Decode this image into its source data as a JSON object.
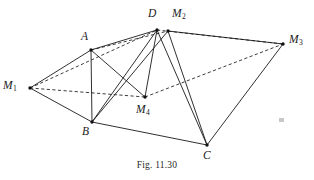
{
  "figure": {
    "caption": "Fig. 11.30",
    "stroke_color": "#1a1a1a",
    "background_color": "#ffffff",
    "vertices": [
      {
        "id": "M1",
        "label": "M",
        "subscript": "1",
        "x": 30,
        "y": 88,
        "label_x": 3,
        "label_y": 80
      },
      {
        "id": "A",
        "label": "A",
        "subscript": "",
        "x": 91,
        "y": 50,
        "label_x": 81,
        "label_y": 31
      },
      {
        "id": "B",
        "label": "B",
        "subscript": "",
        "x": 92,
        "y": 122,
        "label_x": 82,
        "label_y": 126
      },
      {
        "id": "D",
        "label": "D",
        "subscript": "",
        "x": 157,
        "y": 30,
        "label_x": 148,
        "label_y": 8
      },
      {
        "id": "M2",
        "label": "M",
        "subscript": "2",
        "x": 168,
        "y": 31,
        "label_x": 172,
        "label_y": 8
      },
      {
        "id": "M3",
        "label": "M",
        "subscript": "3",
        "x": 283,
        "y": 44,
        "label_x": 289,
        "label_y": 34
      },
      {
        "id": "C",
        "label": "C",
        "subscript": "",
        "x": 207,
        "y": 145,
        "label_x": 203,
        "label_y": 150
      },
      {
        "id": "M4",
        "label": "M",
        "subscript": "4",
        "x": 145,
        "y": 97,
        "label_x": 136,
        "label_y": 104
      }
    ],
    "edges_solid": [
      {
        "name": "M1-A",
        "from": "M1",
        "to": "A"
      },
      {
        "name": "M1-B",
        "from": "M1",
        "to": "B"
      },
      {
        "name": "A-B",
        "from": "A",
        "to": "B"
      },
      {
        "name": "A-D",
        "from": "A",
        "to": "D"
      },
      {
        "name": "A-M4",
        "from": "A",
        "to": "M4"
      },
      {
        "name": "B-C",
        "from": "B",
        "to": "C"
      },
      {
        "name": "B-D",
        "from": "B",
        "to": "D"
      },
      {
        "name": "B-M2",
        "from": "B",
        "to": "M2"
      },
      {
        "name": "D-M4",
        "from": "D",
        "to": "M4"
      },
      {
        "name": "D-C",
        "from": "D",
        "to": "C"
      },
      {
        "name": "M2-C",
        "from": "M2",
        "to": "C"
      },
      {
        "name": "M2-M3",
        "from": "M2",
        "to": "M3"
      },
      {
        "name": "M3-C",
        "from": "M3",
        "to": "C"
      }
    ],
    "edges_dashed": [
      {
        "name": "M1-D-hidden",
        "from": "M1",
        "to": "D"
      },
      {
        "name": "M1-M4-hidden",
        "from": "M1",
        "to": "M4"
      },
      {
        "name": "M4-M3-hidden",
        "from": "M4",
        "to": "M3"
      },
      {
        "name": "A-M2-hidden",
        "from": "A",
        "to": "M2"
      },
      {
        "name": "D-M3-hidden",
        "from": "D",
        "to": "M3"
      }
    ]
  }
}
